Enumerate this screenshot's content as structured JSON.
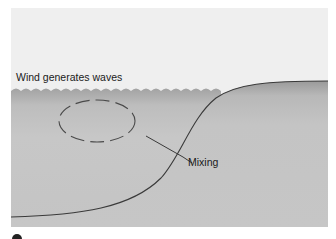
{
  "diagram": {
    "labels": {
      "wind": "Wind generates waves",
      "mixing": "Mixing"
    },
    "colors": {
      "sky": "#efefef",
      "water_top": "#a9a9a9",
      "water_mid": "#c2c2c2",
      "water_bottom": "#c6c6c6",
      "line": "#3a3a3a",
      "dashes": "#4a4a4a"
    }
  }
}
